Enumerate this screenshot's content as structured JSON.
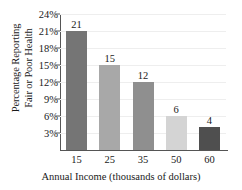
{
  "chart_data": {
    "type": "bar",
    "title": "",
    "categories": [
      "15",
      "25",
      "35",
      "50",
      "60"
    ],
    "values": [
      21,
      15,
      12,
      6,
      4
    ],
    "bar_labels": [
      "21",
      "15",
      "12",
      "6",
      "4"
    ],
    "bar_colors": [
      "#757575",
      "#a8a8a8",
      "#8f8f8f",
      "#d4d4d4",
      "#4f4f4f"
    ],
    "xlabel": "Annual Income (thousands of dollars)",
    "ylabel_line1": "Percentage Reporting",
    "ylabel_line2": "Fair or Poor Health",
    "ytick_labels": [
      "24%",
      "21%",
      "18%",
      "15%",
      "12%",
      "9%",
      "6%",
      "3%"
    ],
    "ytick_values": [
      24,
      21,
      18,
      15,
      12,
      9,
      6,
      3
    ],
    "ylim": [
      0,
      24
    ],
    "grid": true,
    "legend": "none",
    "axis_color": "#555555",
    "grid_color": "#eeeeee",
    "text_color": "#1a1a1a"
  }
}
